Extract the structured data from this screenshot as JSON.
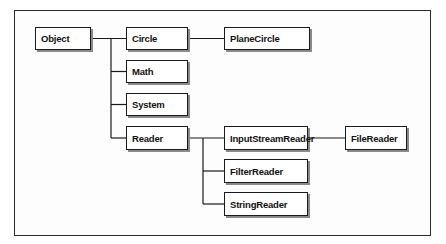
{
  "diagram": {
    "type": "class-hierarchy",
    "nodes": {
      "object": {
        "label": "Object"
      },
      "circle": {
        "label": "Circle"
      },
      "plane_circle": {
        "label": "PlaneCircle"
      },
      "math": {
        "label": "Math"
      },
      "system": {
        "label": "System"
      },
      "reader": {
        "label": "Reader"
      },
      "input_stream_reader": {
        "label": "InputStreamReader"
      },
      "file_reader": {
        "label": "FileReader"
      },
      "filter_reader": {
        "label": "FilterReader"
      },
      "string_reader": {
        "label": "StringReader"
      }
    },
    "edges": [
      [
        "Object",
        "Circle"
      ],
      [
        "Object",
        "Math"
      ],
      [
        "Object",
        "System"
      ],
      [
        "Object",
        "Reader"
      ],
      [
        "Circle",
        "PlaneCircle"
      ],
      [
        "Reader",
        "InputStreamReader"
      ],
      [
        "Reader",
        "FilterReader"
      ],
      [
        "Reader",
        "StringReader"
      ],
      [
        "InputStreamReader",
        "FileReader"
      ]
    ]
  }
}
